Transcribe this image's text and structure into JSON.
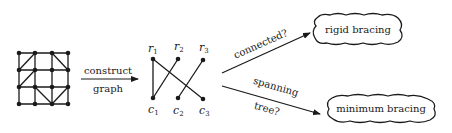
{
  "diagram": {
    "colors": {
      "ink": "#1a1a1a",
      "background": "#ffffff"
    },
    "grid_framework": {
      "rows": 4,
      "cols": 4,
      "node_x": [
        19,
        35,
        52,
        68
      ],
      "node_y": [
        53,
        70,
        87,
        104
      ],
      "diagonals": [
        {
          "cell": [
            0,
            0
          ],
          "dir": "up"
        },
        {
          "cell": [
            0,
            2
          ],
          "dir": "down"
        },
        {
          "cell": [
            1,
            0
          ],
          "dir": "up"
        },
        {
          "cell": [
            2,
            1
          ],
          "dir": "down"
        },
        {
          "cell": [
            2,
            2
          ],
          "dir": "up"
        }
      ]
    },
    "arrow_construct": {
      "label_top": "construct",
      "label_bottom": "graph"
    },
    "bipartite_graph": {
      "row_nodes": [
        {
          "name": "r",
          "sub": "1"
        },
        {
          "name": "r",
          "sub": "2"
        },
        {
          "name": "r",
          "sub": "3"
        }
      ],
      "col_nodes": [
        {
          "name": "c",
          "sub": "1"
        },
        {
          "name": "c",
          "sub": "2"
        },
        {
          "name": "c",
          "sub": "3"
        }
      ],
      "edges": [
        [
          "r1",
          "c1"
        ],
        [
          "r1",
          "c3"
        ],
        [
          "r2",
          "c1"
        ],
        [
          "r3",
          "c2"
        ]
      ]
    },
    "arrow_connected": {
      "label": "connected?"
    },
    "arrow_spanning": {
      "label_top": "spanning",
      "label_bottom": "tree?"
    },
    "result_top": {
      "label": "rigid bracing"
    },
    "result_bottom": {
      "label": "minimum bracing"
    }
  }
}
